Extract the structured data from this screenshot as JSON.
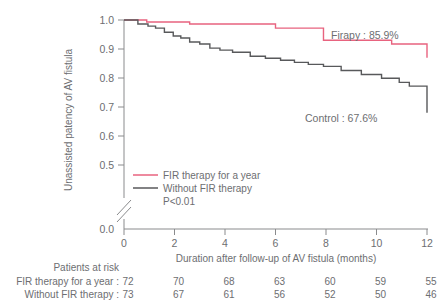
{
  "chart_data": {
    "type": "line",
    "title": "",
    "xlabel": "Duration after follow-up of AV fistula (months)",
    "ylabel": "Unassisted patency of AV fistula",
    "xlim": [
      0,
      12
    ],
    "ylim": [
      0.45,
      1.0
    ],
    "xticks": [
      0,
      2,
      4,
      6,
      8,
      10,
      12
    ],
    "xtick_labels": [
      "0",
      "2",
      "4",
      "6",
      "8",
      "10",
      "12"
    ],
    "yticks": [
      0.5,
      0.6,
      0.7,
      0.8,
      0.9,
      1.0
    ],
    "ytick_labels": [
      "0.5",
      "0.6",
      "0.7",
      "0.8",
      "0.9",
      "1.0"
    ],
    "y_break_label": "0.0",
    "grid": false,
    "axis_break": true,
    "legend_position": "lower-left-inside",
    "series": [
      {
        "name": "FIR therapy for a year",
        "color": "#e8637f",
        "final_label": "Firapy : 85.9%",
        "step_x": [
          0,
          0.35,
          0.9,
          2.0,
          2.6,
          3.0,
          6.0,
          6.4,
          7.9,
          8.3,
          10.6,
          11.0,
          12.0
        ],
        "step_y": [
          1.0,
          1.0,
          0.993,
          0.993,
          0.986,
          0.986,
          0.972,
          0.972,
          0.93,
          0.93,
          0.917,
          0.917,
          0.87
        ]
      },
      {
        "name": "Without FIR therapy",
        "color": "#58595b",
        "final_label": "Control : 67.6%",
        "step_x": [
          0,
          0.3,
          0.55,
          0.95,
          1.25,
          1.6,
          1.95,
          2.25,
          2.6,
          3.0,
          3.4,
          3.8,
          4.3,
          5.0,
          5.6,
          6.2,
          6.75,
          7.3,
          7.9,
          8.6,
          9.4,
          10.2,
          10.9,
          11.3,
          12.0
        ],
        "step_y": [
          1.0,
          1.0,
          0.986,
          0.979,
          0.972,
          0.958,
          0.945,
          0.938,
          0.924,
          0.917,
          0.903,
          0.896,
          0.889,
          0.875,
          0.868,
          0.861,
          0.854,
          0.847,
          0.84,
          0.826,
          0.812,
          0.799,
          0.785,
          0.772,
          0.68
        ]
      }
    ],
    "annotations": [
      {
        "text": "Firapy : 85.9%",
        "x": 8.2,
        "y": 0.955
      },
      {
        "text": "Control : 67.6%",
        "x": 7.7,
        "y": 0.735
      }
    ],
    "legend": {
      "items": [
        {
          "label": "FIR therapy for a year",
          "color": "#e8637f"
        },
        {
          "label": "Without FIR therapy",
          "color": "#58595b"
        }
      ],
      "pvalue": "P<0.01"
    },
    "at_risk": {
      "header": "Patients at risk",
      "columns": [
        0,
        2,
        4,
        6,
        8,
        10,
        12
      ],
      "rows": [
        {
          "label": "FIR therapy for a year :",
          "values": [
            "72",
            "70",
            "68",
            "63",
            "60",
            "59",
            "55"
          ]
        },
        {
          "label": "Without FIR therapy :",
          "values": [
            "73",
            "67",
            "61",
            "56",
            "52",
            "50",
            "46"
          ]
        }
      ]
    }
  }
}
